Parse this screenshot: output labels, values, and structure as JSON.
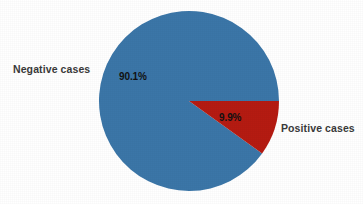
{
  "chart_data": {
    "type": "pie",
    "title": "",
    "subtitle": "",
    "xlabel": "",
    "ylabel": "",
    "legend_position": "none",
    "grid": false,
    "background_color": "#ffffff",
    "start_angle_deg": 0,
    "direction": "clockwise",
    "center": {
      "x": 189,
      "y": 101
    },
    "radius": 90,
    "categories": [
      "Negative cases",
      "Positive cases"
    ],
    "values": [
      90.1,
      9.9
    ],
    "value_unit": "percent",
    "colors": [
      "#3b76a8",
      "#b51b12"
    ],
    "slices": [
      {
        "label": "Negative cases",
        "value": 90.1,
        "display_value": "90.1%",
        "color": "#3b76a8",
        "start_angle_deg": 35.6,
        "end_angle_deg": 360.0
      },
      {
        "label": "Positive cases",
        "value": 9.9,
        "display_value": "9.9%",
        "color": "#b51b12",
        "start_angle_deg": 0.0,
        "end_angle_deg": 35.6
      }
    ],
    "annotations": []
  },
  "labels": {
    "negative_outer": "Negative cases",
    "positive_outer": "Positive cases",
    "negative_percent": "90.1%",
    "positive_percent": "9.9%"
  }
}
